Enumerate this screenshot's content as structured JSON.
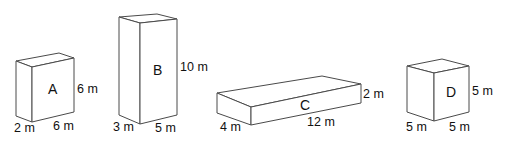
{
  "boxes": [
    {
      "name": "A",
      "width": "6 m",
      "depth": "2 m",
      "height": "6 m"
    },
    {
      "name": "B",
      "width": "5 m",
      "depth": "3 m",
      "height": "10 m"
    },
    {
      "name": "C",
      "width": "12 m",
      "depth": "4 m",
      "height": "2 m"
    },
    {
      "name": "D",
      "width": "5 m",
      "depth": "5 m",
      "height": "5 m"
    }
  ],
  "colors": {
    "line": "#4a4a4a",
    "text": "#111111",
    "background": "#ffffff"
  }
}
